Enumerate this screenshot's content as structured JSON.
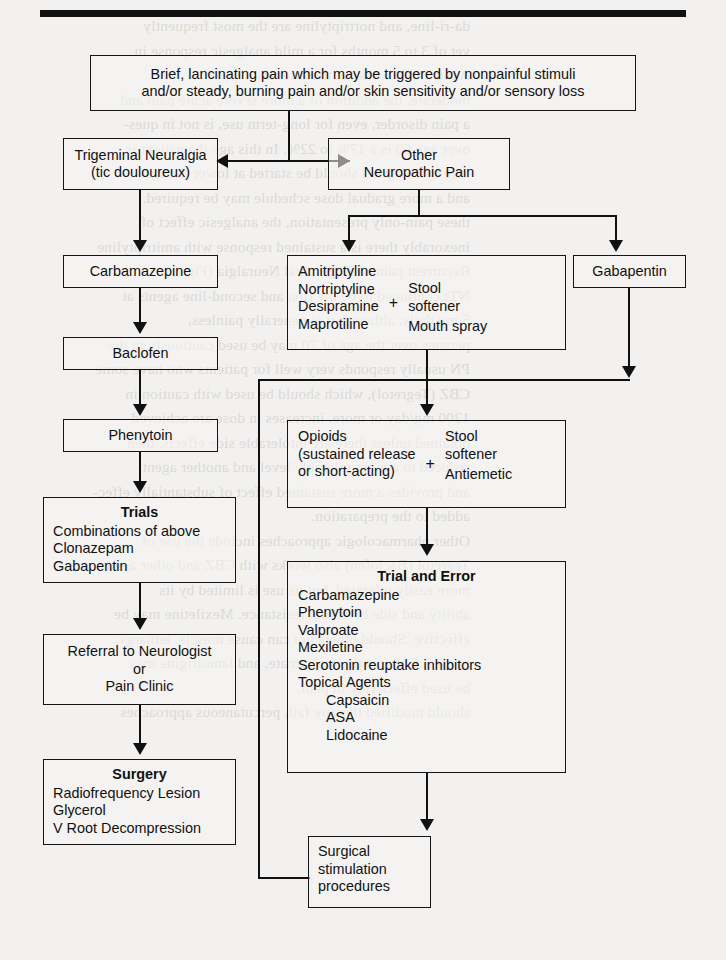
{
  "figure": {
    "type": "clinical-algorithm-flowchart",
    "rule_above": true
  },
  "nodes": {
    "entry": {
      "id": "entry",
      "lines": [
        "Brief, lancinating pain which may be triggered by nonpainful stimuli",
        "and/or steady, burning pain and/or skin sensitivity and/or sensory loss"
      ]
    },
    "trigeminal": {
      "id": "trigeminal-neuralgia",
      "lines": [
        "Trigeminal Neuralgia",
        "(tic douloureux)"
      ]
    },
    "other_pain": {
      "id": "other-neuropathic-pain",
      "lines": [
        "Other",
        "Neuropathic Pain"
      ]
    },
    "carbamazepine": {
      "id": "carbamazepine",
      "label": "Carbamazepine"
    },
    "baclofen": {
      "id": "baclofen",
      "label": "Baclofen"
    },
    "phenytoin": {
      "id": "phenytoin",
      "label": "Phenytoin"
    },
    "trials": {
      "id": "trials",
      "title": "Trials",
      "items": [
        "Combinations of above",
        "Clonazepam",
        "Gabapentin"
      ]
    },
    "referral": {
      "id": "referral",
      "lines": [
        "Referral to Neurologist",
        "or",
        "Pain Clinic"
      ]
    },
    "surgery": {
      "id": "surgery",
      "title": "Surgery",
      "items": [
        "Radiofrequency Lesion",
        "Glycerol",
        "V Root Decompression"
      ]
    },
    "antidepressants": {
      "id": "antidepressants-plus-adjuncts",
      "left_items": [
        "Amitriptyline",
        "Nortriptyline",
        "Desipramine",
        "Maprotiline"
      ],
      "operator": "+",
      "right_items": [
        "Stool",
        "softener",
        "Mouth spray"
      ]
    },
    "gabapentin": {
      "id": "gabapentin",
      "label": "Gabapentin"
    },
    "opioids": {
      "id": "opioids-plus-adjuncts",
      "left_items": [
        "Opioids",
        "(sustained release",
        "or short-acting)"
      ],
      "operator": "+",
      "right_items": [
        "Stool",
        "softener",
        "Antiemetic"
      ]
    },
    "trial_and_error": {
      "id": "trial-and-error",
      "title": "Trial and Error",
      "items": [
        "Carbamazepine",
        "Phenytoin",
        "Valproate",
        "Mexiletine",
        "Serotonin reuptake inhibitors",
        "Topical Agents"
      ],
      "sub_items": [
        "Capsaicin",
        "ASA",
        "Lidocaine"
      ]
    },
    "surgical_stim": {
      "id": "surgical-stimulation-procedures",
      "lines": [
        "Surgical",
        "stimulation",
        "procedures"
      ]
    }
  },
  "background_text": {
    "note": "faint show-through of printed book text behind the figure",
    "right_column": [
      "da-ri-line, and nortriptyline are the most frequently",
      "vet of 3 to 5 months for a mild analgesic response in",
      "Aged 2 to 4 weeks at these levels.",
      "moderate, the addition of a more severe acute pain and",
      "a pain disorder, even for long-term use, is not in ques-",
      "over age 60 is a 17% to 22%. In this age the patient is",
      "sure these agents should be started at lower dosages.",
      "and a more gradual dose schedule may be required.",
      "these pain-only presentation, the analgesic effect of",
      "inexorably there is a sustained response with amitriptyline",
      "Recurrent pain of Trigeminal Neuralgia (Fig. 1)",
      "NTs continued to be the first and second-line agents at",
      "5 mg daily, although it is generally painless,",
      "persons over the age of 70 may be used cautiously in the",
      "PN usually responds very well for patients who have some",
      "CBZ (Tegretol), which should be used with caution in",
      "1200 mg/day or more, increases in dose are achieved",
      "obtained unless there are intolerable side effects, then",
      "reduced to a more tolerable level and another agent",
      "and provides a more sustained effect of substantially effec-",
      "added to the preparation.",
      "Other pharmacologic approaches include the use of",
      "Tegretol (Baclofen) also works with CBZ and other agents",
      "more easily tolerated, but its use is limited by its",
      "ability and side bleeding, resistance. Mexiletine may be",
      "effective. Should others but can cause muscle, lethargy,",
      "nausea. Gabapentin, topiramate, and lamotrigine may",
      "be used effectively in pain.",
      "should modified therapy fail, percutaneous approaches"
    ]
  }
}
